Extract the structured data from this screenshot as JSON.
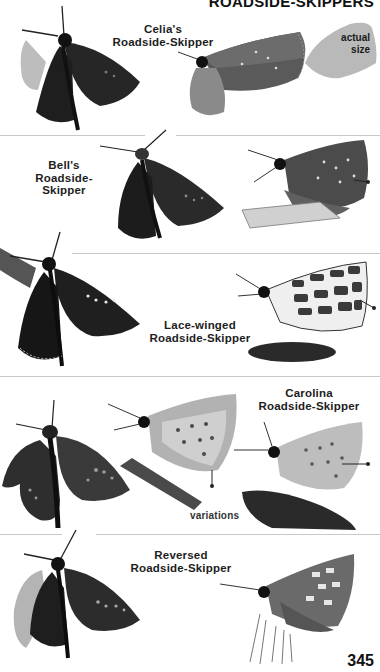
{
  "page": {
    "section_title": "ROADSIDE-SKIPPERS",
    "page_number": "345",
    "actual_size_label": "actual size",
    "colors": {
      "ink": "#1a1a1a",
      "divider": "#c8c8c8",
      "dark_wing": "#2b2b2b",
      "light_wing": "#9a9a9a",
      "silhouette": "#b9b9b9"
    }
  },
  "species": [
    {
      "name_line1": "Celia's",
      "name_line2": "Roadside-Skipper",
      "figures": [
        "dorsal-view-dark",
        "ventral-view-side"
      ],
      "icon": "butterfly-icon"
    },
    {
      "name_line1": "Bell's",
      "name_line2": "Roadside-Skipper",
      "figures": [
        "dorsal-view-dark",
        "ventral-view-side"
      ],
      "icon": "butterfly-icon"
    },
    {
      "name_line1": "Lace-winged",
      "name_line2": "Roadside-Skipper",
      "figures": [
        "dorsal-view-dark",
        "ventral-view-lace-pattern"
      ],
      "icon": "butterfly-icon"
    },
    {
      "name_line1": "Carolina",
      "name_line2": "Roadside-Skipper",
      "figures": [
        "dorsal-view-dark",
        "ventral-view-variation-1",
        "ventral-view-variation-2"
      ],
      "caption": "variations",
      "icon": "butterfly-icon"
    },
    {
      "name_line1": "Reversed",
      "name_line2": "Roadside-Skipper",
      "figures": [
        "dorsal-view-dark",
        "ventral-view-side"
      ],
      "icon": "butterfly-icon"
    }
  ]
}
